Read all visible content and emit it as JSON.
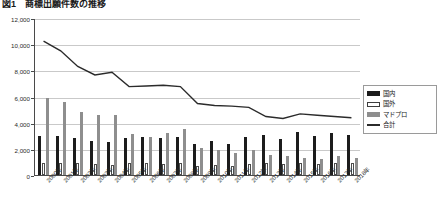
{
  "title": "図1　商標出願件数の推移",
  "colors": {
    "kokunai": "#1c1c1c",
    "kokugai": "#ffffff",
    "madopro": "#8e8e8e",
    "goukei": "#2b2b2b",
    "grid": "#c9c9c9",
    "axis": "#4a4a4a"
  },
  "legend": {
    "position": "right",
    "items": [
      {
        "key": "kokunai",
        "label": "国内"
      },
      {
        "key": "kokugai",
        "label": "国外"
      },
      {
        "key": "madopro",
        "label": "マドプロ"
      },
      {
        "key": "goukei",
        "label": "合計"
      }
    ]
  },
  "yaxis": {
    "ticks": [
      "0",
      "2,000",
      "4,000",
      "6,000",
      "8,000",
      "10,000",
      "12,000"
    ],
    "min": 0,
    "max": 12000,
    "step": 2000
  },
  "chart_data": {
    "type": "bar",
    "title": "図1　商標出願件数の推移",
    "xlabel": "",
    "ylabel": "",
    "ylim": [
      0,
      12000
    ],
    "grid": true,
    "legend_position": "right",
    "categories": [
      "2000年",
      "2001年",
      "2002年",
      "2003年",
      "2004年",
      "2005年",
      "2006年",
      "2007年",
      "2008年",
      "2009年",
      "2010年",
      "2011年",
      "2012年",
      "2013年",
      "2014年",
      "2015年",
      "2016年",
      "2017年",
      "2018年"
    ],
    "series": [
      {
        "name": "国内",
        "type": "bar",
        "color": "#1c1c1c",
        "values": [
          2950,
          3000,
          2800,
          2600,
          2500,
          2850,
          2900,
          2850,
          2900,
          2400,
          2600,
          2400,
          2900,
          3050,
          2750,
          3300,
          2950,
          3200,
          3050
        ]
      },
      {
        "name": "国外",
        "type": "bar",
        "color": "#ffffff",
        "values": [
          900,
          950,
          900,
          850,
          800,
          900,
          900,
          880,
          950,
          700,
          750,
          700,
          850,
          900,
          820,
          950,
          880,
          950,
          900
        ]
      },
      {
        "name": "マドプロ",
        "type": "bar",
        "color": "#8e8e8e",
        "values": [
          5900,
          5600,
          4800,
          4550,
          4600,
          3100,
          2900,
          3200,
          3500,
          2100,
          1900,
          1700,
          1900,
          1550,
          1450,
          1300,
          1250,
          1450,
          1300
        ]
      },
      {
        "name": "合計",
        "type": "line",
        "color": "#2b2b2b",
        "values": [
          10300,
          9550,
          8350,
          7700,
          7900,
          6800,
          6850,
          6900,
          6800,
          5500,
          5350,
          5300,
          5200,
          4500,
          4350,
          4700,
          4600,
          4500,
          4400
        ]
      }
    ]
  }
}
